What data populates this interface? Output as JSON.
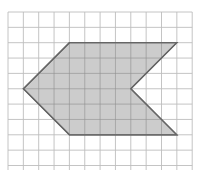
{
  "diagram": {
    "type": "grid-polygon",
    "grid": {
      "origin_x": 8,
      "origin_y": 12,
      "cell_size": 15.35,
      "columns": 12,
      "rows": 10,
      "line_color": "#bdbdbd"
    },
    "shape": {
      "name": "arrow-shaped hexagon",
      "fill": "#c3c3c3",
      "stroke": "#666666",
      "vertices_grid": [
        [
          4,
          2
        ],
        [
          11,
          2
        ],
        [
          8,
          5
        ],
        [
          11,
          8
        ],
        [
          4,
          8
        ],
        [
          1,
          5
        ]
      ]
    }
  }
}
